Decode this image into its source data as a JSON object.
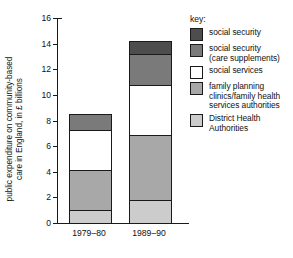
{
  "chart_data": {
    "type": "bar",
    "subtype": "stacked-bar",
    "title": "",
    "xlabel": "",
    "ylabel_lines": [
      "public expenditure on community-based",
      "care in England, in £ billions"
    ],
    "ylabel": "public expenditure on community-based care in England, in £ billions",
    "categories": [
      "1979–80",
      "1989–90"
    ],
    "ylim": [
      0,
      16
    ],
    "yticks": [
      0,
      2,
      4,
      6,
      8,
      10,
      12,
      14,
      16
    ],
    "ytick_labels": [
      "0",
      "2",
      "4",
      "6",
      "8",
      "10",
      "12",
      "14",
      "16"
    ],
    "grid": false,
    "legend_position": "right",
    "legend_title": "key:",
    "stack_order_bottom_to_top": [
      "District Health Authorities",
      "family planning clinics/family health services authorities",
      "social services",
      "social security (care supplements)",
      "social security"
    ],
    "series": [
      {
        "name": "social security",
        "label_lines": [
          "social security"
        ],
        "color": "#4d4d4d",
        "values": [
          0.0,
          1.1
        ]
      },
      {
        "name": "social security (care supplements)",
        "label_lines": [
          "social security",
          "(care supplements)"
        ],
        "color": "#7a7a7a",
        "values": [
          1.3,
          2.5
        ]
      },
      {
        "name": "social services",
        "label_lines": [
          "social services"
        ],
        "color": "#ffffff",
        "values": [
          3.2,
          4.0
        ]
      },
      {
        "name": "family planning clinics/family health services authorities",
        "label_lines": [
          "family planning",
          "clinics/family health",
          "services authorities"
        ],
        "color": "#a8a8a8",
        "values": [
          3.2,
          5.1
        ]
      },
      {
        "name": "District Health Authorities",
        "label_lines": [
          "District Health",
          "Authorities"
        ],
        "color": "#cccccc",
        "values": [
          1.1,
          1.9
        ]
      }
    ],
    "cumulative_tops": {
      "1979–80": [
        1.1,
        4.3,
        7.5,
        8.8,
        8.8
      ],
      "1989–90": [
        1.9,
        7.0,
        11.0,
        13.5,
        14.6
      ]
    },
    "totals": [
      8.8,
      14.6
    ],
    "axis_color": "#1a1a1a"
  }
}
